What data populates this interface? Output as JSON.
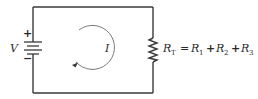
{
  "diagram": {
    "type": "series-circuit",
    "battery": {
      "label": "V",
      "positive_sign": "+",
      "negative_sign": "−"
    },
    "current": {
      "label": "I",
      "direction": "clockwise"
    },
    "resistor": {
      "symbol": "R",
      "total_subscript": "T",
      "equals": "=",
      "plus": "+",
      "terms": [
        {
          "symbol": "R",
          "subscript": "1"
        },
        {
          "symbol": "R",
          "subscript": "2"
        },
        {
          "symbol": "R",
          "subscript": "3"
        }
      ]
    },
    "colors": {
      "wire": "#3a3a3a",
      "arc": "#7a7a7a",
      "text": "#2a2a2a",
      "background": "#ffffff"
    }
  }
}
